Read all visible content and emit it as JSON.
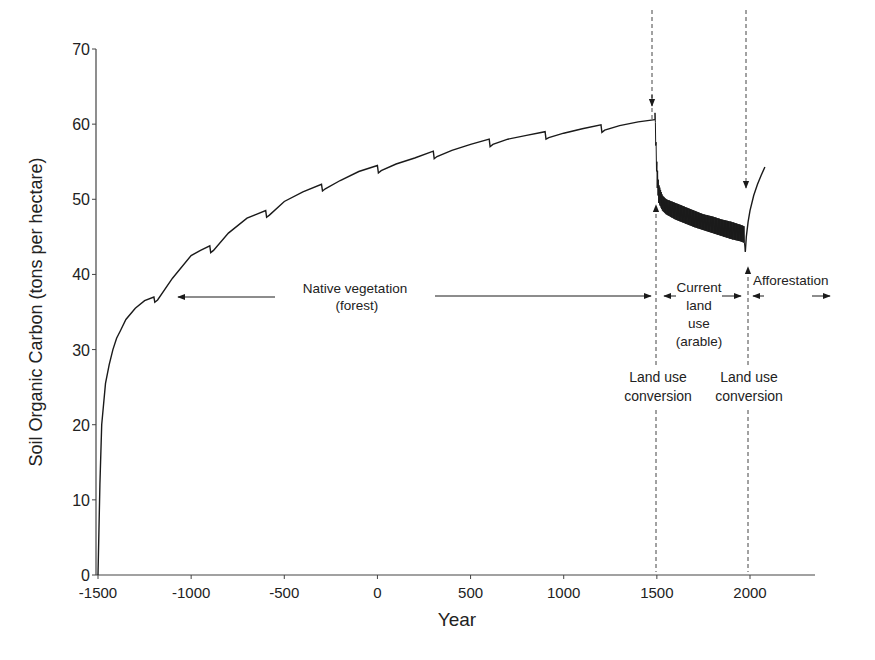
{
  "chart_data": {
    "type": "line",
    "title": "",
    "xlabel": "Year",
    "ylabel": "Soil Organic Carbon (tons per hectare)",
    "xlim": [
      -1500,
      2350
    ],
    "ylim": [
      0,
      70
    ],
    "grid": false,
    "legend": "none",
    "x_ticks": [
      -1500,
      -1000,
      -500,
      0,
      500,
      1000,
      1500,
      2000
    ],
    "x_tick_labels": [
      "-1500",
      "-1000",
      "-500",
      "0",
      "500",
      "1000",
      "1500",
      "2000"
    ],
    "y_ticks": [
      0,
      10,
      20,
      30,
      40,
      50,
      60,
      70
    ],
    "y_tick_labels": [
      "0",
      "10",
      "20",
      "30",
      "40",
      "50",
      "60",
      "70"
    ],
    "series": [
      {
        "name": "Native vegetation (forest)",
        "x": [
          -1500,
          -1490,
          -1480,
          -1460,
          -1440,
          -1420,
          -1400,
          -1380,
          -1350,
          -1300,
          -1250,
          -1200,
          -1195,
          -1180,
          -1100,
          -1000,
          -950,
          -900,
          -895,
          -880,
          -800,
          -700,
          -650,
          -600,
          -595,
          -580,
          -500,
          -400,
          -300,
          -295,
          -280,
          -200,
          -100,
          0,
          5,
          20,
          100,
          200,
          300,
          305,
          320,
          400,
          500,
          600,
          605,
          620,
          700,
          800,
          900,
          905,
          920,
          1000,
          1100,
          1200,
          1205,
          1220,
          1300,
          1400,
          1490
        ],
        "y": [
          0,
          12,
          20,
          25.5,
          28,
          30,
          31.5,
          32.5,
          34,
          35.5,
          36.5,
          37,
          36.3,
          36.6,
          39.5,
          42.5,
          43.2,
          43.8,
          42.9,
          43.2,
          45.5,
          47.5,
          48,
          48.5,
          47.6,
          47.9,
          49.7,
          51,
          52,
          51.1,
          51.4,
          52.5,
          53.7,
          54.5,
          53.5,
          53.8,
          54.7,
          55.5,
          56.4,
          55.4,
          55.7,
          56.5,
          57.3,
          58,
          57,
          57.3,
          58,
          58.5,
          59,
          58,
          58.2,
          58.8,
          59.4,
          59.9,
          58.9,
          59.2,
          59.8,
          60.3,
          60.6
        ]
      },
      {
        "name": "Current land use (arable)",
        "x": [
          1490,
          1500,
          1510,
          1530,
          1550,
          1600,
          1650,
          1700,
          1750,
          1800,
          1850,
          1900,
          1950,
          1970
        ],
        "y_upper": [
          61.5,
          55,
          52,
          50.5,
          50,
          49.5,
          49,
          48.5,
          48,
          47.7,
          47.3,
          47,
          46.6,
          46.4
        ],
        "y_lower": [
          60.6,
          52,
          49.5,
          48.5,
          48,
          47.3,
          46.8,
          46.3,
          45.9,
          45.5,
          45.1,
          44.7,
          44.4,
          44.2
        ]
      },
      {
        "name": "Afforestation",
        "x": [
          1975,
          1980,
          1990,
          2000,
          2020,
          2040,
          2060,
          2080
        ],
        "y": [
          43,
          45,
          47,
          48.5,
          50.5,
          52,
          53.2,
          54.3
        ]
      }
    ],
    "annotations": [
      {
        "text_lines": [
          "Native vegetation",
          "(forest)"
        ],
        "type": "double-arrow",
        "x_from": -1060,
        "x_to": 1485,
        "y": 37
      },
      {
        "text_lines": [
          "Current",
          "land",
          "use",
          "(arable)"
        ],
        "type": "double-arrow",
        "x_from": 1510,
        "x_to": 1960,
        "y": 37
      },
      {
        "text_lines": [
          "Afforestation"
        ],
        "type": "double-arrow",
        "x_from": 2000,
        "x_to": 2330,
        "y": 37
      },
      {
        "text_lines": [
          "Land use",
          "conversion"
        ],
        "type": "dashed-vline",
        "x": 1500
      },
      {
        "text_lines": [
          "Land use",
          "conversion"
        ],
        "type": "dashed-vline",
        "x": 1990
      }
    ]
  },
  "labels": {
    "xlabel": "Year",
    "ylabel": "Soil Organic Carbon (tons per hectare)",
    "native_1": "Native vegetation",
    "native_2": "(forest)",
    "current_1": "Current",
    "current_2": "land",
    "current_3": "use",
    "current_4": "(arable)",
    "afforestation": "Afforestation",
    "conv1_1": "Land use",
    "conv1_2": "conversion",
    "conv2_1": "Land use",
    "conv2_2": "conversion"
  },
  "colors": {
    "line": "#1a1a1a",
    "axis": "#444444",
    "text": "#222222"
  }
}
